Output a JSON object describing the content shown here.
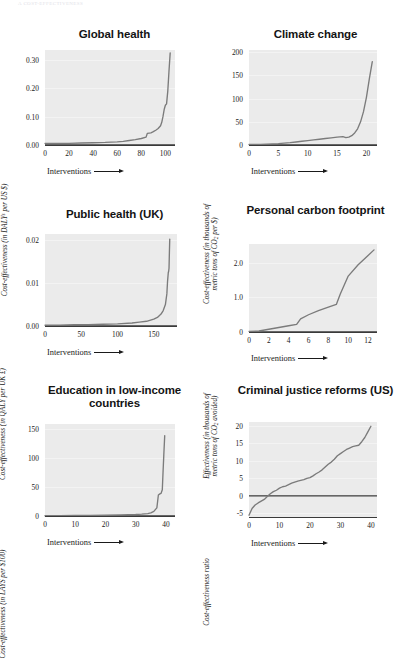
{
  "page_header": "A COST-EFFECTIVENESS",
  "x_axis_title": "Interventions",
  "chart_data": [
    {
      "type": "line",
      "title": "Global health",
      "ylabel": "Cost-effectiveness (in DALYs per US $)",
      "xlabel": "Interventions",
      "grid": true,
      "legend": "none",
      "xlim": [
        0,
        108
      ],
      "ylim": [
        0,
        0.335
      ],
      "xticks": [
        0,
        20,
        40,
        60,
        80,
        100
      ],
      "yticks": [
        0.0,
        0.1,
        0.2,
        0.3
      ],
      "ytick_labels": [
        "0.00",
        "0.10",
        "0.20",
        "0.30"
      ],
      "zero_line": 0.0,
      "x": [
        0,
        5,
        10,
        20,
        30,
        40,
        50,
        60,
        65,
        70,
        75,
        80,
        84,
        85,
        88,
        90,
        92,
        94,
        96,
        97,
        98,
        99,
        100,
        101,
        102,
        103,
        104
      ],
      "y": [
        0.006,
        0.006,
        0.006,
        0.006,
        0.007,
        0.008,
        0.009,
        0.011,
        0.013,
        0.016,
        0.019,
        0.023,
        0.028,
        0.041,
        0.043,
        0.047,
        0.052,
        0.058,
        0.068,
        0.08,
        0.1,
        0.125,
        0.14,
        0.145,
        0.19,
        0.26,
        0.325
      ]
    },
    {
      "type": "line",
      "title": "Climate change",
      "ylabel": "Cost-effectiveness (in thousands of metric tons of CO2 per $)",
      "xlabel": "Interventions",
      "grid": true,
      "legend": "none",
      "xlim": [
        0,
        21.8
      ],
      "ylim": [
        0,
        205
      ],
      "xticks": [
        0,
        5,
        10,
        15,
        20
      ],
      "yticks": [
        0,
        50,
        100,
        150,
        200
      ],
      "ytick_labels": [
        "0",
        "50",
        "100",
        "150",
        "200"
      ],
      "zero_line": 0,
      "x": [
        0,
        1,
        2,
        3,
        4,
        5,
        6,
        7,
        8,
        9,
        10,
        11,
        12,
        13,
        14,
        15,
        16,
        16.5,
        17,
        17.5,
        18,
        18.5,
        19,
        19.5,
        20,
        20.5,
        21
      ],
      "y": [
        1,
        1,
        1.5,
        2,
        2.5,
        3,
        4,
        5,
        6.5,
        8,
        9.5,
        11,
        12.5,
        14,
        15.5,
        17,
        18,
        16,
        17,
        20,
        26,
        35,
        50,
        72,
        103,
        143,
        180
      ]
    },
    {
      "type": "line",
      "title": "Public health (UK)",
      "ylabel": "Cost-effectiveness (in QALY per UK £)",
      "xlabel": "Interventions",
      "grid": true,
      "legend": "none",
      "xlim": [
        0,
        182
      ],
      "ylim": [
        0,
        0.0215
      ],
      "xticks": [
        0,
        50,
        100,
        150
      ],
      "yticks": [
        0.0,
        0.01,
        0.02
      ],
      "ytick_labels": [
        "0.00",
        "0.01",
        "0.02"
      ],
      "zero_line": 0.0,
      "x": [
        0,
        20,
        40,
        60,
        80,
        100,
        120,
        130,
        140,
        150,
        155,
        160,
        163,
        166,
        168,
        169,
        170,
        170.5,
        171,
        171.5,
        172
      ],
      "y": [
        0.0002,
        0.0002,
        0.0003,
        0.0003,
        0.0004,
        0.0005,
        0.0007,
        0.0009,
        0.0011,
        0.0016,
        0.002,
        0.0028,
        0.0036,
        0.005,
        0.0075,
        0.0105,
        0.0125,
        0.0128,
        0.0135,
        0.017,
        0.0203
      ]
    },
    {
      "type": "line",
      "title": "Personal carbon footprint",
      "ylabel": "Effectiveness (in thousands of metric tons of CO2 avoided)",
      "xlabel": "Interventions",
      "grid": true,
      "legend": "none",
      "xlim": [
        0,
        12.9
      ],
      "ylim": [
        0,
        2.55
      ],
      "xticks": [
        0,
        2,
        4,
        6,
        8,
        10,
        12
      ],
      "yticks": [
        0,
        1.0,
        2.0
      ],
      "ytick_labels": [
        "0",
        "1.0",
        "2.0"
      ],
      "zero_line": 0,
      "x": [
        0,
        1,
        2,
        3,
        4,
        4.8,
        5.2,
        6,
        7,
        8,
        8.8,
        9.2,
        10,
        11,
        12,
        12.6
      ],
      "y": [
        0.02,
        0.03,
        0.08,
        0.13,
        0.18,
        0.22,
        0.38,
        0.5,
        0.62,
        0.72,
        0.8,
        1.1,
        1.62,
        1.95,
        2.22,
        2.38
      ]
    },
    {
      "type": "line",
      "title": "Education in low-income countries",
      "ylabel": "Cost-effectiveness (in LAYS per $100)",
      "xlabel": "Interventions",
      "grid": true,
      "legend": "none",
      "xlim": [
        0,
        43
      ],
      "ylim": [
        0,
        158
      ],
      "xticks": [
        0,
        10,
        20,
        30,
        40
      ],
      "yticks": [
        0,
        50,
        100,
        150
      ],
      "ytick_labels": [
        "0",
        "50",
        "100",
        "150"
      ],
      "zero_line": 0,
      "x": [
        0,
        5,
        10,
        15,
        20,
        25,
        30,
        32,
        34,
        35,
        36,
        37,
        37.5,
        38,
        38.4,
        38.8,
        39,
        39.3,
        39.6
      ],
      "y": [
        0.5,
        0.6,
        0.8,
        1.0,
        1.3,
        1.8,
        2.6,
        3.2,
        4.2,
        5.5,
        8,
        14,
        36,
        38,
        39,
        45,
        70,
        105,
        138
      ]
    },
    {
      "type": "line",
      "title": "Criminal justice reforms (US)",
      "ylabel": "Cost-effectiveness ratio",
      "xlabel": "Interventions",
      "grid": true,
      "legend": "none",
      "xlim": [
        0,
        42
      ],
      "ylim": [
        -6,
        21
      ],
      "xticks": [
        0,
        10,
        20,
        30,
        40
      ],
      "yticks": [
        -5,
        0,
        5,
        10,
        15,
        20
      ],
      "ytick_labels": [
        "-5",
        "0",
        "5",
        "10",
        "15",
        "20"
      ],
      "zero_line": 0,
      "x": [
        0,
        1,
        2,
        3,
        4,
        5,
        6,
        7,
        8,
        9,
        10,
        11,
        12,
        13,
        14,
        15,
        16,
        17,
        18,
        19,
        20,
        21,
        22,
        23,
        24,
        25,
        26,
        27,
        28,
        29,
        30,
        31,
        32,
        33,
        34,
        35,
        36,
        37,
        38,
        39,
        40
      ],
      "y": [
        -5.5,
        -3.6,
        -2.6,
        -2.0,
        -1.5,
        -1.0,
        -0.2,
        0.6,
        1.2,
        1.6,
        2.2,
        2.6,
        2.8,
        3.2,
        3.6,
        3.9,
        4.2,
        4.4,
        4.6,
        5.0,
        5.2,
        5.7,
        6.3,
        6.8,
        7.4,
        8.2,
        9.0,
        9.6,
        10.4,
        11.4,
        12.0,
        12.6,
        13.2,
        13.6,
        14.0,
        14.2,
        14.4,
        15.4,
        16.6,
        18.2,
        19.8
      ]
    }
  ]
}
